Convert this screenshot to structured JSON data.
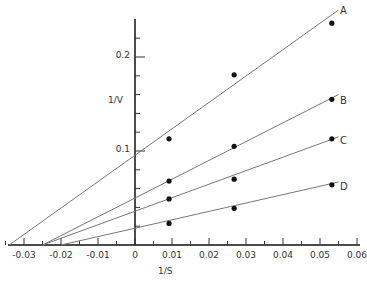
{
  "chart_data": {
    "type": "line",
    "title": "",
    "xlabel": "1/S",
    "ylabel": "1/V",
    "xlim": [
      -0.035,
      0.06
    ],
    "ylim": [
      0,
      0.24
    ],
    "grid": false,
    "x_ticks": [
      "-0.03",
      "-0.02",
      "-0.01",
      "0",
      "0.01",
      "0.02",
      "0.03",
      "0.04",
      "0.05",
      "0.06"
    ],
    "y_ticks": [
      "0.1",
      "0.2"
    ],
    "x": [
      0.0092,
      0.0268,
      0.0532
    ],
    "series": [
      {
        "name": "A",
        "values": [
          0.113,
          0.181,
          0.236
        ],
        "fit_line": {
          "x_start": -0.034,
          "x_end": 0.055,
          "y_start": 0,
          "y_end": 0.25
        }
      },
      {
        "name": "B",
        "values": [
          0.068,
          0.105,
          0.155
        ],
        "fit_line": {
          "x_start": -0.025,
          "x_end": 0.055,
          "y_start": 0,
          "y_end": 0.16
        }
      },
      {
        "name": "C",
        "values": [
          0.049,
          0.07,
          0.113
        ],
        "fit_line": {
          "x_start": -0.025,
          "x_end": 0.055,
          "y_start": 0,
          "y_end": 0.115
        }
      },
      {
        "name": "D",
        "values": [
          0.023,
          0.039,
          0.064
        ],
        "fit_line": {
          "x_start": -0.02,
          "x_end": 0.055,
          "y_start": 0,
          "y_end": 0.067
        }
      }
    ]
  }
}
